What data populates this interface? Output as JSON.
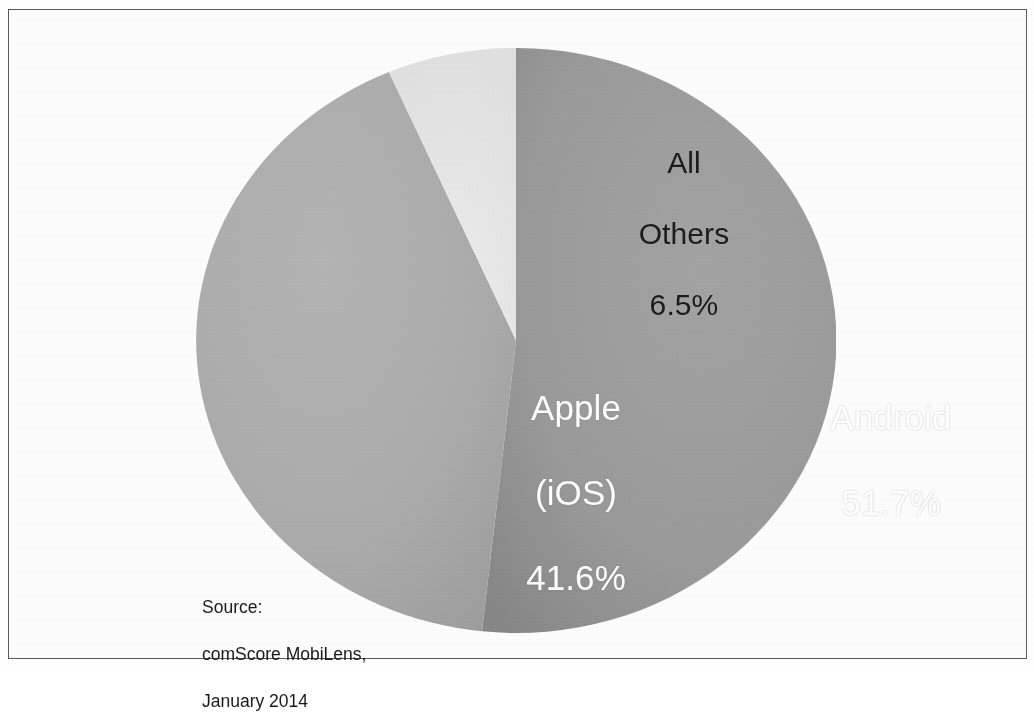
{
  "figure": {
    "kind": "pie-chart-scan",
    "frame_border_color": "#5a5a5a",
    "background_color": "#ffffff"
  },
  "labels": {
    "android": {
      "name": "Android",
      "value": "51.7%",
      "text_color": "#ffffff"
    },
    "apple": {
      "name_line1": "Apple",
      "name_line2": "(iOS)",
      "value": "41.6%",
      "text_color": "#ffffff"
    },
    "others": {
      "name_line1": "All",
      "name_line2": "Others",
      "value": "6.5%",
      "text_color": "#1c1c1c"
    }
  },
  "source": {
    "line1": "Source:",
    "line2": "comScore MobiLens,",
    "line3": "January 2014",
    "full": "Source:\ncomScore MobiLens,\nJanuary 2014"
  },
  "chart_data": {
    "type": "pie",
    "title": "",
    "subtitle": "",
    "xlabel": "",
    "ylabel": "",
    "grid": false,
    "legend_position": "none",
    "label_mode": "inside-slice",
    "units": "percent",
    "total": 99.8,
    "start_angle_deg": 0,
    "direction": "clockwise",
    "center_px": [
      516,
      340
    ],
    "radius_px": [
      320,
      292
    ],
    "categories": [
      "Android",
      "Apple (iOS)",
      "All Others"
    ],
    "values": [
      51.7,
      41.6,
      6.5
    ],
    "value_labels": [
      "51.7%",
      "41.6%",
      "6.5%"
    ],
    "colors": [
      "#9a9a9a",
      "#ababab",
      "#e4e4e4"
    ],
    "slices": [
      {
        "label": "Android",
        "value": 51.7,
        "value_label": "51.7%",
        "color": "#9a9a9a",
        "start_angle_deg": 0,
        "end_angle_deg": 186.1,
        "text_color": "#ffffff"
      },
      {
        "label": "Apple (iOS)",
        "value": 41.6,
        "value_label": "41.6%",
        "color": "#ababab",
        "start_angle_deg": 186.1,
        "end_angle_deg": 336.6,
        "text_color": "#ffffff"
      },
      {
        "label": "All Others",
        "value": 6.5,
        "value_label": "6.5%",
        "color": "#e4e4e4",
        "start_angle_deg": 336.6,
        "end_angle_deg": 360,
        "text_color": "#1c1c1c"
      }
    ],
    "annotations": [
      "Source: comScore MobiLens, January 2014"
    ]
  }
}
